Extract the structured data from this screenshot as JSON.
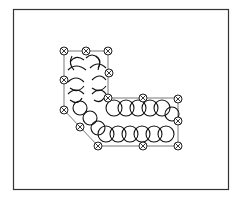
{
  "diagram": {
    "type": "stitch-pattern",
    "shape": "L-shape",
    "colors": {
      "frame": "#333333",
      "outline": "#555555",
      "stitch": "#111111",
      "background": "#ffffff"
    },
    "frame": {
      "x": 13,
      "y": 9,
      "w": 215,
      "h": 180
    },
    "outline_points": [
      [
        64,
        51
      ],
      [
        108,
        51
      ],
      [
        108,
        98
      ],
      [
        178,
        98
      ],
      [
        178,
        146
      ],
      [
        98,
        146
      ],
      [
        80,
        127
      ],
      [
        64,
        110
      ]
    ],
    "nodes": [
      {
        "x": 64,
        "y": 51
      },
      {
        "x": 86,
        "y": 51
      },
      {
        "x": 108,
        "y": 51
      },
      {
        "x": 109,
        "y": 73
      },
      {
        "x": 64,
        "y": 80
      },
      {
        "x": 108,
        "y": 98
      },
      {
        "x": 143,
        "y": 98
      },
      {
        "x": 178,
        "y": 99
      },
      {
        "x": 64,
        "y": 110
      },
      {
        "x": 80,
        "y": 127
      },
      {
        "x": 178,
        "y": 121
      },
      {
        "x": 98,
        "y": 146
      },
      {
        "x": 143,
        "y": 146
      },
      {
        "x": 178,
        "y": 146
      }
    ],
    "loop_rows": [
      {
        "name": "upper-horizontal",
        "y": 108,
        "x_start": 108,
        "x_end": 172,
        "count": 6,
        "r": 8
      },
      {
        "name": "lower-horizontal",
        "y": 134,
        "x_start": 98,
        "x_end": 172,
        "count": 7,
        "r": 8
      }
    ]
  }
}
